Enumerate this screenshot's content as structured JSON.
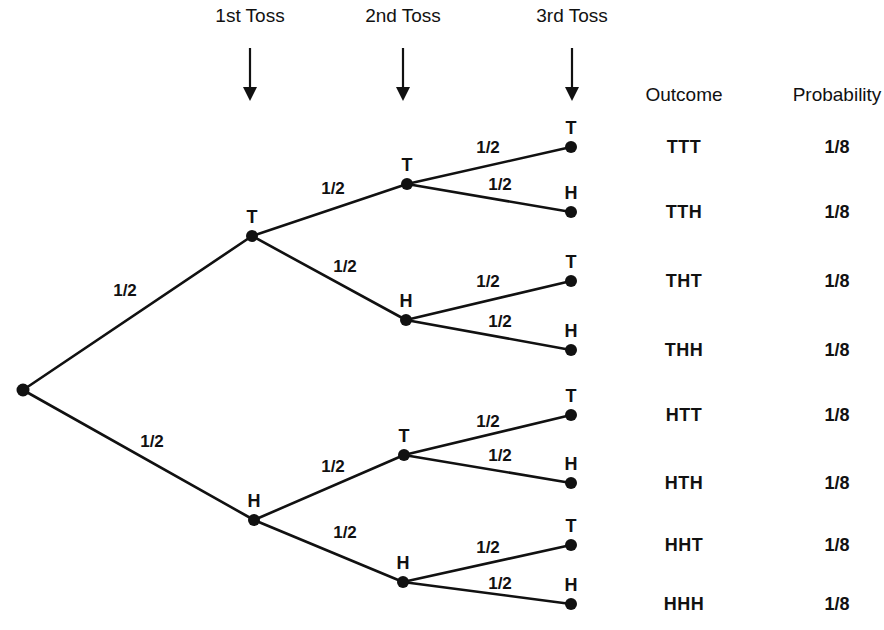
{
  "diagram": {
    "stage_headers": [
      {
        "label": "1st Toss",
        "x": 250
      },
      {
        "label": "2nd Toss",
        "x": 403
      },
      {
        "label": "3rd Toss",
        "x": 572
      }
    ],
    "columns": {
      "outcome_header": "Outcome",
      "probability_header": "Probability"
    },
    "edge_probability_label": "1/2",
    "node_labels": {
      "heads": "H",
      "tails": "T"
    },
    "colors": {
      "background": "#ffffff",
      "ink": "#111111"
    },
    "nodes": [
      {
        "id": "root",
        "label": "",
        "x": 23,
        "y": 390,
        "level": 0
      },
      {
        "id": "T",
        "label": "T",
        "x": 252,
        "y": 236,
        "level": 1
      },
      {
        "id": "H",
        "label": "H",
        "x": 254,
        "y": 520,
        "level": 1
      },
      {
        "id": "TT",
        "label": "T",
        "x": 407,
        "y": 184,
        "level": 2
      },
      {
        "id": "TH",
        "label": "H",
        "x": 406,
        "y": 320,
        "level": 2
      },
      {
        "id": "HT",
        "label": "T",
        "x": 404,
        "y": 455,
        "level": 2
      },
      {
        "id": "HH",
        "label": "H",
        "x": 403,
        "y": 582,
        "level": 2
      },
      {
        "id": "TTT",
        "label": "T",
        "x": 571,
        "y": 147,
        "level": 3
      },
      {
        "id": "TTH",
        "label": "H",
        "x": 571,
        "y": 212,
        "level": 3
      },
      {
        "id": "THT",
        "label": "T",
        "x": 571,
        "y": 281,
        "level": 3
      },
      {
        "id": "THH",
        "label": "H",
        "x": 571,
        "y": 350,
        "level": 3
      },
      {
        "id": "HTT",
        "label": "T",
        "x": 571,
        "y": 415,
        "level": 3
      },
      {
        "id": "HTH",
        "label": "H",
        "x": 571,
        "y": 483,
        "level": 3
      },
      {
        "id": "HHT",
        "label": "T",
        "x": 571,
        "y": 545,
        "level": 3
      },
      {
        "id": "HHH",
        "label": "H",
        "x": 571,
        "y": 604,
        "level": 3
      }
    ],
    "edges": [
      {
        "from": "root",
        "to": "T",
        "label": "1/2",
        "lx": 125,
        "ly": 296
      },
      {
        "from": "root",
        "to": "H",
        "label": "1/2",
        "lx": 152,
        "ly": 447
      },
      {
        "from": "T",
        "to": "TT",
        "label": "1/2",
        "lx": 333,
        "ly": 194
      },
      {
        "from": "T",
        "to": "TH",
        "label": "1/2",
        "lx": 345,
        "ly": 272
      },
      {
        "from": "H",
        "to": "HT",
        "label": "1/2",
        "lx": 333,
        "ly": 472
      },
      {
        "from": "H",
        "to": "HH",
        "label": "1/2",
        "lx": 345,
        "ly": 538
      },
      {
        "from": "TT",
        "to": "TTT",
        "label": "1/2",
        "lx": 488,
        "ly": 153
      },
      {
        "from": "TT",
        "to": "TTH",
        "label": "1/2",
        "lx": 500,
        "ly": 190
      },
      {
        "from": "TH",
        "to": "THT",
        "label": "1/2",
        "lx": 488,
        "ly": 287
      },
      {
        "from": "TH",
        "to": "THH",
        "label": "1/2",
        "lx": 500,
        "ly": 327
      },
      {
        "from": "HT",
        "to": "HTT",
        "label": "1/2",
        "lx": 488,
        "ly": 427
      },
      {
        "from": "HT",
        "to": "HTH",
        "label": "1/2",
        "lx": 500,
        "ly": 461
      },
      {
        "from": "HH",
        "to": "HHT",
        "label": "1/2",
        "lx": 488,
        "ly": 553
      },
      {
        "from": "HH",
        "to": "HHH",
        "label": "1/2",
        "lx": 500,
        "ly": 589
      }
    ],
    "rows": [
      {
        "outcome": "TTT",
        "probability": "1/8",
        "y": 147
      },
      {
        "outcome": "TTH",
        "probability": "1/8",
        "y": 212
      },
      {
        "outcome": "THT",
        "probability": "1/8",
        "y": 281
      },
      {
        "outcome": "THH",
        "probability": "1/8",
        "y": 350
      },
      {
        "outcome": "HTT",
        "probability": "1/8",
        "y": 415
      },
      {
        "outcome": "HTH",
        "probability": "1/8",
        "y": 483
      },
      {
        "outcome": "HHT",
        "probability": "1/8",
        "y": 545
      },
      {
        "outcome": "HHH",
        "probability": "1/8",
        "y": 604
      }
    ],
    "layout": {
      "outcome_column_x": 684,
      "probability_column_x": 837,
      "column_header_y": 101,
      "stage_header_y": 22,
      "arrow_top_y": 48,
      "arrow_bottom_y": 101
    }
  }
}
